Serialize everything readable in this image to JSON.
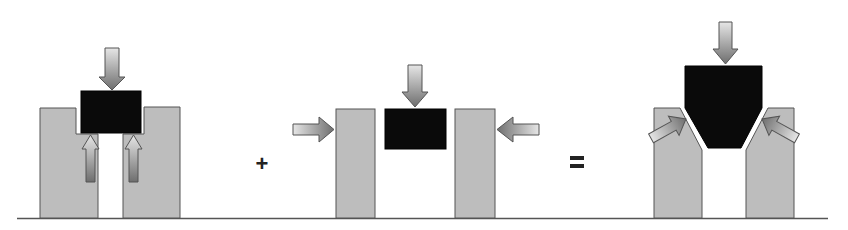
{
  "diagram": {
    "colors": {
      "pillar_fill": "#bdbdbd",
      "block_fill": "#0a0a0a",
      "arrow_gradient_light": "#e6e6e6",
      "arrow_gradient_dark": "#6e6e6e",
      "outline": "#555555",
      "baseline": "#555555"
    },
    "operators": {
      "plus": "+",
      "equals": "="
    },
    "panels": [
      {
        "name": "vertical-load-in-stepped-slot",
        "elements": [
          "left-pillar-notched",
          "right-pillar-notched",
          "black-block",
          "down-arrow",
          "left-up-arrow",
          "right-up-arrow"
        ]
      },
      {
        "name": "lateral-squeeze",
        "elements": [
          "left-pillar",
          "right-pillar",
          "black-block",
          "down-arrow",
          "left-side-arrow",
          "right-side-arrow"
        ]
      },
      {
        "name": "wedge-in-chamfered-slot",
        "elements": [
          "left-pillar-chamfered",
          "right-pillar-chamfered",
          "tapered-black-block",
          "down-arrow",
          "left-diagonal-arrow",
          "right-diagonal-arrow"
        ]
      }
    ]
  }
}
